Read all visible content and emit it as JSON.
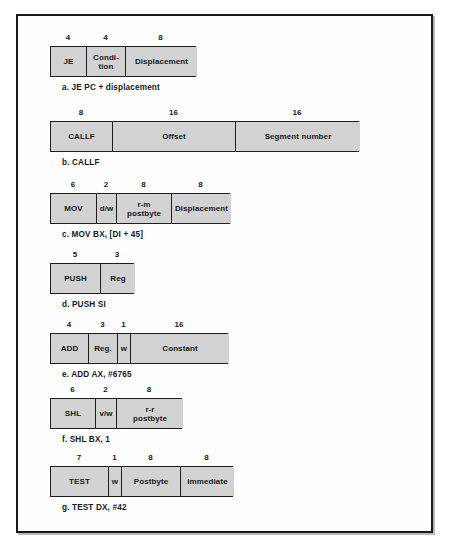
{
  "figure": {
    "box_fill": "#d2d2d2",
    "box_stroke": "#1b1d1f",
    "page_background": "#ffffff",
    "rows": [
      {
        "id": "je",
        "caption": "a.  JE PC + displacement",
        "left": 50,
        "top": 46,
        "fields": [
          {
            "label": "JE",
            "bits": "4",
            "width": 36
          },
          {
            "label": "Condi-\ntion",
            "bits": "4",
            "width": 39
          },
          {
            "label": "Displacement",
            "bits": "8",
            "width": 71
          }
        ]
      },
      {
        "id": "callf",
        "caption": "b.  CALLF",
        "left": 50,
        "top": 121,
        "fields": [
          {
            "label": "CALLF",
            "bits": "8",
            "width": 62
          },
          {
            "label": "Offset",
            "bits": "16",
            "width": 123
          },
          {
            "label": "Segment number",
            "bits": "16",
            "width": 124
          }
        ]
      },
      {
        "id": "mov",
        "caption": "c.  MOV BX, [DI + 45]",
        "left": 50,
        "top": 193,
        "fields": [
          {
            "label": "MOV",
            "bits": "6",
            "width": 46
          },
          {
            "label": "d/w",
            "bits": "2",
            "width": 20
          },
          {
            "label": "r-m\npostbyte",
            "bits": "8",
            "width": 55
          },
          {
            "label": "Displacement",
            "bits": "8",
            "width": 59
          }
        ]
      },
      {
        "id": "push",
        "caption": "d.  PUSH SI",
        "left": 50,
        "top": 263,
        "fields": [
          {
            "label": "PUSH",
            "bits": "5",
            "width": 50
          },
          {
            "label": "Reg",
            "bits": "3",
            "width": 34
          }
        ]
      },
      {
        "id": "add",
        "caption": "e.  ADD AX, #6765",
        "left": 50,
        "top": 333,
        "fields": [
          {
            "label": "ADD",
            "bits": "4",
            "width": 38
          },
          {
            "label": "Reg.",
            "bits": "3",
            "width": 29
          },
          {
            "label": "w",
            "bits": "1",
            "width": 13
          },
          {
            "label": "Constant",
            "bits": "16",
            "width": 98
          }
        ]
      },
      {
        "id": "shl",
        "caption": "f.  SHL BX, 1",
        "left": 50,
        "top": 398,
        "fields": [
          {
            "label": "SHL",
            "bits": "6",
            "width": 45
          },
          {
            "label": "v/w",
            "bits": "2",
            "width": 21
          },
          {
            "label": "r-r\npostbyte",
            "bits": "8",
            "width": 66
          }
        ]
      },
      {
        "id": "test",
        "caption": "g.  TEST DX, #42",
        "left": 50,
        "top": 466,
        "fields": [
          {
            "label": "TEST",
            "bits": "7",
            "width": 58
          },
          {
            "label": "w",
            "bits": "1",
            "width": 13
          },
          {
            "label": "Postbyte",
            "bits": "8",
            "width": 59
          },
          {
            "label": "Immediate",
            "bits": "8",
            "width": 53
          }
        ]
      }
    ]
  }
}
